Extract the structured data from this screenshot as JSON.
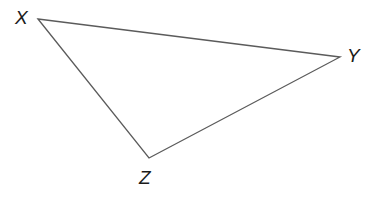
{
  "figure": {
    "type": "triangle-diagram",
    "background_color": "#ffffff",
    "stroke_color": "#5b5b5b",
    "stroke_width": 1.3,
    "label_color": "#1b1b1b",
    "fill_color": "none",
    "width": 384,
    "height": 209
  },
  "shape": {
    "name": "triangle",
    "vertices": [
      {
        "label": "X",
        "x": 38,
        "y": 19
      },
      {
        "label": "Y",
        "x": 340,
        "y": 57
      },
      {
        "label": "Z",
        "x": 149,
        "y": 158
      }
    ],
    "path": "M 38 19 L 340 57 L 149 158 Z",
    "edges": [
      {
        "from": "X",
        "to": "Y"
      },
      {
        "from": "Y",
        "to": "Z"
      },
      {
        "from": "Z",
        "to": "X"
      }
    ]
  },
  "labels": {
    "x": "X",
    "y": "Y",
    "z": "Z"
  }
}
